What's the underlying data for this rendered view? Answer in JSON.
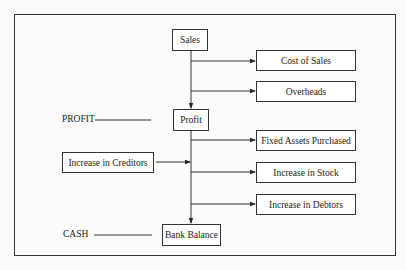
{
  "diagram": {
    "nodes": {
      "sales": "Sales",
      "cost_of_sales": "Cost of Sales",
      "overheads": "Overheads",
      "profit": "Profit",
      "fixed_assets": "Fixed Assets Purchased",
      "creditors": "Increase in Creditors",
      "stock": "Increase in Stock",
      "debtors": "Increase in Debtors",
      "bank_balance": "Bank Balance"
    },
    "side_labels": {
      "profit": "PROFIT",
      "cash": "CASH"
    },
    "edges": [
      {
        "from": "sales",
        "to": "cost_of_sales"
      },
      {
        "from": "sales",
        "to": "overheads"
      },
      {
        "from": "sales",
        "to": "profit"
      },
      {
        "from": "profit",
        "to": "fixed_assets"
      },
      {
        "from": "creditors",
        "to": "trunk"
      },
      {
        "from": "profit",
        "to": "stock"
      },
      {
        "from": "profit",
        "to": "debtors"
      },
      {
        "from": "profit",
        "to": "bank_balance"
      }
    ]
  }
}
